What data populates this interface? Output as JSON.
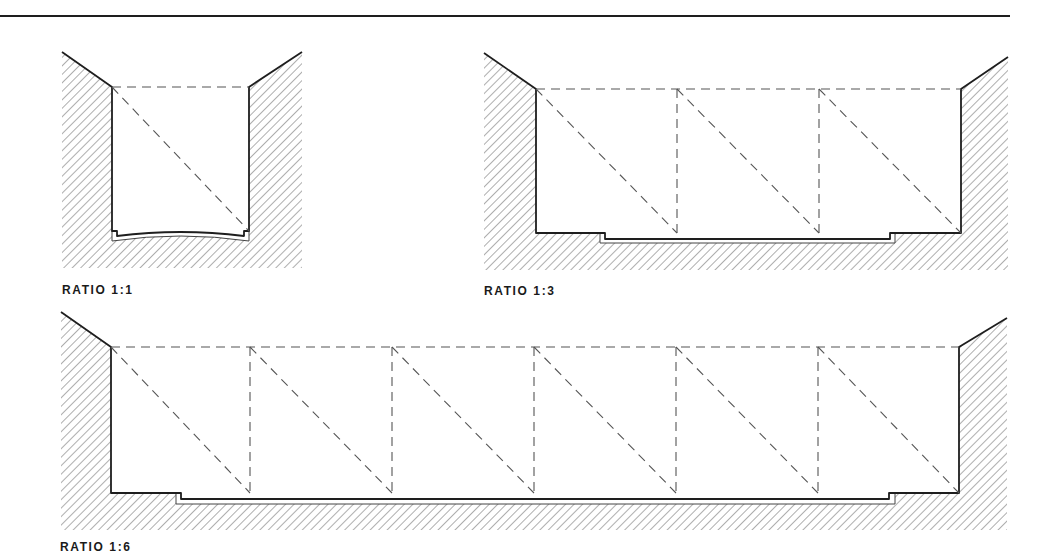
{
  "colors": {
    "line": "#1e1e1e",
    "dash": "#555555",
    "hatch": "#6a6a6a",
    "background": "#ffffff"
  },
  "top_rule": {
    "x1": 0,
    "x2": 1010,
    "y": 16
  },
  "diagrams": [
    {
      "id": "ratio-1-1",
      "label": "RATIO 1:1",
      "label_pos": {
        "x": 62,
        "y": 283
      },
      "ratio": "1:1",
      "hatch_box": {
        "x": 62,
        "y": 52,
        "w": 240,
        "h": 216
      },
      "left_wall_x": 112,
      "right_wall_x": 249,
      "top_y": 87,
      "left_rim_start": {
        "x": 62,
        "y": 52
      },
      "right_rim_end": {
        "x": 302,
        "y": 52
      },
      "floor": {
        "type": "curved",
        "inner_side_y": 231,
        "step_in": 5,
        "curve_side_y": 236,
        "curve_mid_y": 232,
        "outer_side_y": 241,
        "outer_mid_y": 236
      },
      "verticals": [],
      "bays": 1
    },
    {
      "id": "ratio-1-3",
      "label": "RATIO 1:3",
      "label_pos": {
        "x": 484,
        "y": 284
      },
      "ratio": "1:3",
      "hatch_box": {
        "x": 484,
        "y": 53,
        "w": 524,
        "h": 217
      },
      "left_wall_x": 536,
      "right_wall_x": 961,
      "top_y": 89,
      "left_rim_start": {
        "x": 484,
        "y": 53
      },
      "right_rim_end": {
        "x": 1008,
        "y": 57
      },
      "floor": {
        "type": "stepped",
        "inner_y": 233,
        "step_left_x": 605,
        "step_right_x": 890,
        "lower_y": 239,
        "outer_y": 243,
        "outer_left_x": 600,
        "outer_right_x": 895
      },
      "verticals": [
        677,
        819
      ],
      "bays": 3
    },
    {
      "id": "ratio-1-6",
      "label": "RATIO 1:6",
      "label_pos": {
        "x": 60,
        "y": 540
      },
      "ratio": "1:6",
      "hatch_box": {
        "x": 61,
        "y": 312,
        "w": 946,
        "h": 218
      },
      "left_wall_x": 111,
      "right_wall_x": 959,
      "top_y": 347,
      "left_rim_start": {
        "x": 61,
        "y": 312
      },
      "right_rim_end": {
        "x": 1007,
        "y": 318
      },
      "floor": {
        "type": "stepped",
        "inner_y": 493,
        "step_left_x": 181,
        "step_right_x": 889,
        "lower_y": 499,
        "outer_y": 504,
        "outer_left_x": 176,
        "outer_right_x": 895
      },
      "verticals": [
        250,
        392,
        534,
        676,
        818
      ],
      "bays": 6
    }
  ]
}
